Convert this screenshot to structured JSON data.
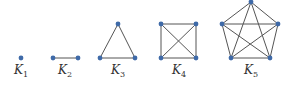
{
  "diagram": {
    "colors": {
      "node": "#3f6aa8",
      "edge": "#555555",
      "label": "#333333"
    },
    "graphs": [
      {
        "name": "K",
        "sub": "1",
        "label_x": 21,
        "nodes": [
          [
            21,
            58
          ]
        ],
        "edges": []
      },
      {
        "name": "K",
        "sub": "2",
        "label_x": 65,
        "nodes": [
          [
            53,
            58
          ],
          [
            78,
            58
          ]
        ],
        "edges": [
          [
            0,
            1
          ]
        ]
      },
      {
        "name": "K",
        "sub": "3",
        "label_x": 118,
        "nodes": [
          [
            100,
            58
          ],
          [
            118,
            24
          ],
          [
            135,
            58
          ]
        ],
        "edges": [
          [
            0,
            1
          ],
          [
            1,
            2
          ],
          [
            0,
            2
          ]
        ]
      },
      {
        "name": "K",
        "sub": "4",
        "label_x": 179,
        "nodes": [
          [
            161,
            24
          ],
          [
            196,
            24
          ],
          [
            161,
            58
          ],
          [
            196,
            58
          ]
        ],
        "edges": [
          [
            0,
            1
          ],
          [
            0,
            2
          ],
          [
            0,
            3
          ],
          [
            1,
            2
          ],
          [
            1,
            3
          ],
          [
            2,
            3
          ]
        ]
      },
      {
        "name": "K",
        "sub": "5",
        "label_x": 251,
        "nodes": [
          [
            251,
            2
          ],
          [
            222,
            24
          ],
          [
            278,
            24
          ],
          [
            231,
            58
          ],
          [
            270,
            58
          ]
        ],
        "edges": [
          [
            0,
            1
          ],
          [
            0,
            2
          ],
          [
            0,
            3
          ],
          [
            0,
            4
          ],
          [
            1,
            2
          ],
          [
            1,
            3
          ],
          [
            1,
            4
          ],
          [
            2,
            3
          ],
          [
            2,
            4
          ],
          [
            3,
            4
          ]
        ]
      }
    ],
    "label_y": 63
  }
}
